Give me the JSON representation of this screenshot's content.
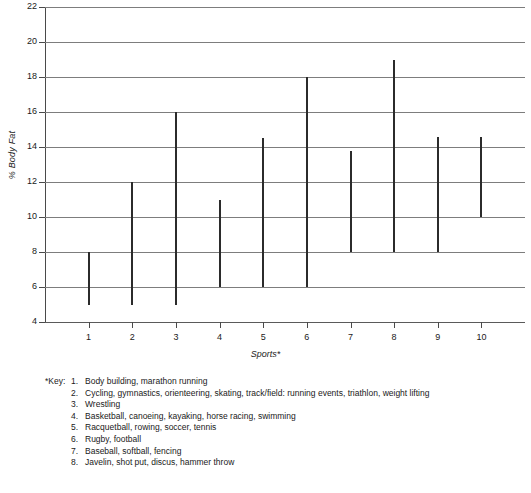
{
  "chart_data": {
    "type": "bar",
    "subtype": "range-bar",
    "title": "",
    "xlabel": "Sports*",
    "ylabel": "% Body Fat",
    "categories": [
      "1",
      "2",
      "3",
      "4",
      "5",
      "6",
      "7",
      "8",
      "9",
      "10"
    ],
    "ylim": [
      4,
      22
    ],
    "yticks": [
      4,
      6,
      8,
      10,
      12,
      14,
      16,
      18,
      20,
      22
    ],
    "ytick_labels": [
      "4",
      "6",
      "8",
      "10",
      "12",
      "14",
      "16",
      "18",
      "20",
      "22"
    ],
    "grid": true,
    "legend": "none",
    "series": [
      {
        "name": "% Body Fat range",
        "low": [
          5,
          5,
          5,
          6,
          6,
          6,
          8,
          8,
          8,
          10
        ],
        "high": [
          8,
          12,
          16,
          11,
          14.5,
          18,
          13.8,
          19,
          14.6,
          14.6
        ]
      }
    ],
    "points": [
      {
        "sport": "1",
        "low": 5,
        "high": 8
      },
      {
        "sport": "2",
        "low": 5,
        "high": 12
      },
      {
        "sport": "3",
        "low": 5,
        "high": 16
      },
      {
        "sport": "4",
        "low": 6,
        "high": 11
      },
      {
        "sport": "5",
        "low": 6,
        "high": 14.5
      },
      {
        "sport": "6",
        "low": 6,
        "high": 18
      },
      {
        "sport": "7",
        "low": 8,
        "high": 13.8
      },
      {
        "sport": "8",
        "low": 8,
        "high": 19
      },
      {
        "sport": "9",
        "low": 8,
        "high": 14.6
      },
      {
        "sport": "10",
        "low": 10,
        "high": 14.6
      }
    ],
    "colors": {
      "bar": "#2b2b2b",
      "grid": "#7d7d7d",
      "axis": "#4a4a4a",
      "background": "#ffffff"
    }
  },
  "axis": {
    "y_title": "% Body Fat",
    "x_title": "Sports*"
  },
  "key": {
    "label": "*Key:",
    "items": [
      {
        "num": "1.",
        "text": "Body building, marathon running"
      },
      {
        "num": "2.",
        "text": "Cycling, gymnastics, orienteering, skating, track/field: running events, triathlon, weight lifting"
      },
      {
        "num": "3.",
        "text": "Wrestling"
      },
      {
        "num": "4.",
        "text": "Basketball, canoeing, kayaking, horse racing, swimming"
      },
      {
        "num": "5.",
        "text": "Racquetball, rowing, soccer, tennis"
      },
      {
        "num": "6.",
        "text": "Rugby, football"
      },
      {
        "num": "7.",
        "text": "Baseball, softball, fencing"
      },
      {
        "num": "8.",
        "text": "Javelin, shot put, discus, hammer throw"
      }
    ]
  }
}
